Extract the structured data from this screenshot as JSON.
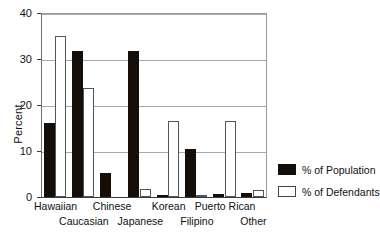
{
  "chart_data": {
    "type": "bar",
    "title": "",
    "xlabel": "",
    "ylabel": "Percent",
    "ylim": [
      0,
      40
    ],
    "yticks": [
      0,
      10,
      20,
      30,
      40
    ],
    "grid": true,
    "legend_position": "right",
    "categories": [
      "Hawaiian",
      "Caucasian",
      "Chinese",
      "Japanese",
      "Korean",
      "Filipino",
      "Puerto Rican",
      "Other"
    ],
    "series": [
      {
        "name": "% of Population",
        "color": "#140d08",
        "values": [
          16.0,
          31.7,
          5.2,
          31.8,
          0.5,
          10.4,
          0.6,
          0.8
        ]
      },
      {
        "name": "% of Defendants",
        "color": "#ffffff",
        "values": [
          35.0,
          23.7,
          0.0,
          1.8,
          16.5,
          0.3,
          16.5,
          1.6
        ]
      }
    ]
  },
  "axis": {
    "y_label": "Percent",
    "y_tick_labels": [
      "40",
      "30",
      "20",
      "10",
      "0"
    ]
  },
  "legend": {
    "items": [
      {
        "label": "% of Population",
        "swatch": "filled-black"
      },
      {
        "label": "% of Defendants",
        "swatch": "outline-white"
      }
    ]
  },
  "title_remnant": ""
}
